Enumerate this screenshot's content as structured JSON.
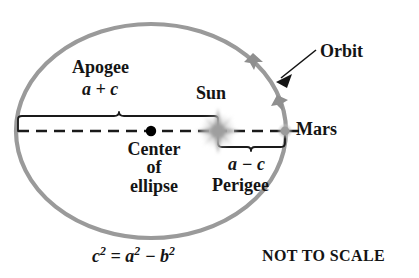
{
  "diagram": {
    "colors": {
      "orbit": "#9a9a9a",
      "axis": "#1a1a1a",
      "bracket": "#1a1a1a",
      "sun": "#b4b4b4",
      "mars": "#a0a0a0",
      "center_dot": "#000000",
      "text": "#141414",
      "background": "#ffffff"
    },
    "labels": {
      "apogee": "Apogee",
      "apogee_value": "a + c",
      "sun": "Sun",
      "orbit": "Orbit",
      "mars": "Mars",
      "center_line1": "Center",
      "center_line2": "of",
      "center_line3": "ellipse",
      "perigee": "Perigee",
      "perigee_value": "a − c",
      "not_to_scale": "NOT TO SCALE"
    },
    "equation": {
      "c": "c",
      "c_exp": "2",
      "equals": "=",
      "a": "a",
      "a_exp": "2",
      "minus": "−",
      "b": "b",
      "b_exp": "2",
      "full_text": "c² = a² − b²"
    },
    "icons": {
      "sun": "sun-burst-icon",
      "mars": "planet-dot-icon",
      "center": "center-dot-icon",
      "orbit_direction": "orbit-direction-arrowhead-icon",
      "orbit_pointer": "orbit-callout-arrow-icon"
    },
    "geometry": {
      "ellipse_cx": 151,
      "ellipse_cy": 131,
      "ellipse_rx": 135,
      "ellipse_ry": 107,
      "sun_x": 218,
      "sun_y": 131,
      "mars_x": 285,
      "mars_y": 131,
      "center_dot_x": 151,
      "center_dot_y": 131,
      "apogee_bracket_from_x": 18,
      "apogee_bracket_to_x": 218,
      "apogee_bracket_y": 116,
      "perigee_bracket_from_x": 218,
      "perigee_bracket_to_x": 285,
      "perigee_bracket_y": 147
    }
  }
}
